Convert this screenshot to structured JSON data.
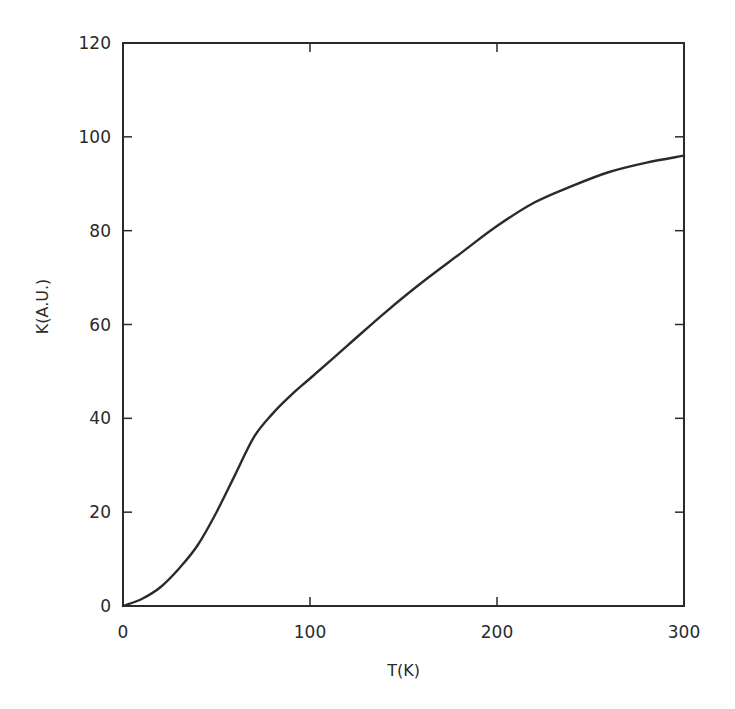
{
  "chart_data": {
    "type": "line",
    "title": "",
    "xlabel": "T(K)",
    "ylabel": "K(A.U.)",
    "xlim": [
      0,
      300
    ],
    "ylim": [
      0,
      120
    ],
    "x_ticks": [
      0,
      100,
      200,
      300
    ],
    "y_ticks": [
      0,
      20,
      40,
      60,
      80,
      100,
      120
    ],
    "grid": false,
    "legend": null,
    "series": [
      {
        "name": "K(T)",
        "color": "#2a2a2a",
        "x": [
          0,
          10,
          20,
          30,
          40,
          50,
          60,
          70,
          80,
          90,
          100,
          120,
          140,
          160,
          180,
          200,
          220,
          240,
          260,
          280,
          300
        ],
        "y": [
          0,
          1.5,
          4,
          8,
          13,
          20,
          28,
          36,
          41,
          45,
          48.5,
          55.5,
          62.5,
          69,
          75,
          81,
          86,
          89.5,
          92.5,
          94.5,
          96
        ]
      }
    ]
  },
  "layout": {
    "plot": {
      "left": 123,
      "right": 684,
      "top": 43,
      "bottom": 606
    },
    "line_color": "#2a2a2a"
  }
}
